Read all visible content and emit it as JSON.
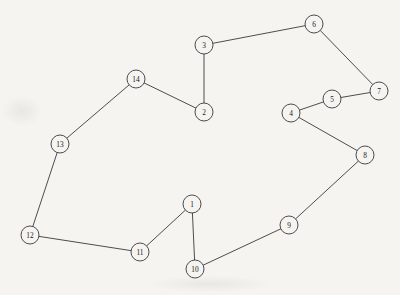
{
  "diagram": {
    "type": "node-link-graph",
    "width": 400,
    "height": 295,
    "background_color": "#f6f4f0",
    "node_fill_color": "#f6f4f0",
    "stroke_color": "#3a3a3a",
    "label_color": "#1c1c1c",
    "node_radius": 9,
    "node_count": 14,
    "edge_count": 14,
    "nodes": [
      {
        "id": "1",
        "label": "1",
        "x": 192,
        "y": 204
      },
      {
        "id": "2",
        "label": "2",
        "x": 204,
        "y": 112
      },
      {
        "id": "3",
        "label": "3",
        "x": 204,
        "y": 45
      },
      {
        "id": "4",
        "label": "4",
        "x": 291,
        "y": 113
      },
      {
        "id": "5",
        "label": "5",
        "x": 332,
        "y": 99
      },
      {
        "id": "6",
        "label": "6",
        "x": 314,
        "y": 24
      },
      {
        "id": "7",
        "label": "7",
        "x": 379,
        "y": 91
      },
      {
        "id": "8",
        "label": "8",
        "x": 365,
        "y": 155
      },
      {
        "id": "9",
        "label": "9",
        "x": 289,
        "y": 225
      },
      {
        "id": "10",
        "label": "10",
        "x": 195,
        "y": 269
      },
      {
        "id": "11",
        "label": "11",
        "x": 140,
        "y": 252
      },
      {
        "id": "12",
        "label": "12",
        "x": 30,
        "y": 235
      },
      {
        "id": "13",
        "label": "13",
        "x": 60,
        "y": 144
      },
      {
        "id": "14",
        "label": "14",
        "x": 136,
        "y": 79
      }
    ],
    "edges": [
      {
        "source": "3",
        "target": "6"
      },
      {
        "source": "6",
        "target": "7"
      },
      {
        "source": "7",
        "target": "5"
      },
      {
        "source": "5",
        "target": "4"
      },
      {
        "source": "4",
        "target": "8"
      },
      {
        "source": "8",
        "target": "9"
      },
      {
        "source": "9",
        "target": "10"
      },
      {
        "source": "10",
        "target": "1"
      },
      {
        "source": "1",
        "target": "11"
      },
      {
        "source": "11",
        "target": "12"
      },
      {
        "source": "12",
        "target": "13"
      },
      {
        "source": "13",
        "target": "14"
      },
      {
        "source": "14",
        "target": "2"
      },
      {
        "source": "2",
        "target": "3"
      }
    ]
  }
}
